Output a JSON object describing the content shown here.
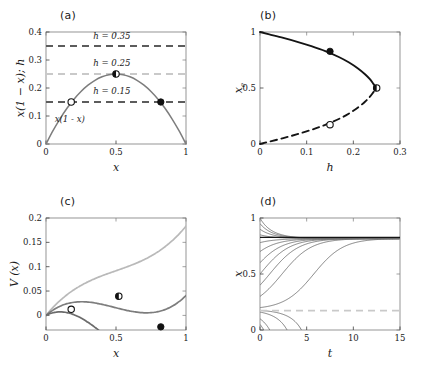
{
  "figure": {
    "panels": [
      {
        "label": "(a)",
        "xlabel": "x",
        "ylabel": "x(1 − x); h",
        "annotation": "x(1 − x)"
      },
      {
        "label": "(b)",
        "xlabel": "h",
        "ylabel": "x"
      },
      {
        "label": "(c)",
        "xlabel": "x",
        "ylabel": "V (x)"
      },
      {
        "label": "(d)",
        "xlabel": "t",
        "ylabel": "x"
      }
    ],
    "ylabel_b_sub": "e",
    "h_line_labels": [
      "h = 0.35",
      "h = 0.25",
      "h = 0.15"
    ]
  },
  "colors": {
    "curve_dark": "#6b6b6b",
    "curve_mid": "#7d7d7d",
    "curve_light": "#b9b9b9",
    "dash_dark": "#5c5c5c",
    "dash_light": "#c9c9c9",
    "solid_black": "#141414",
    "marker_fill": "#111111",
    "marker_open": "#ffffff",
    "axis": "#3d3d3d",
    "frame": "#7a7a7a"
  },
  "chart_data": [
    {
      "panel": "(a)",
      "type": "line",
      "title": "",
      "xlabel": "x",
      "ylabel": "x(1-x); h",
      "xlim": [
        0,
        1
      ],
      "ylim": [
        0,
        0.4
      ],
      "xticks": [
        0,
        0.5,
        1
      ],
      "xticklabels": [
        "0",
        "0.5",
        "1"
      ],
      "yticks": [
        0,
        0.1,
        0.2,
        0.3,
        0.4
      ],
      "yticklabels": [
        "0",
        "0.1",
        "0.2",
        "0.3",
        "0.4"
      ],
      "grid": false,
      "series": [
        {
          "name": "x(1-x)",
          "style": "solid",
          "color": "#7d7d7d",
          "formula": "y = x*(1-x)",
          "x": [
            0,
            0.05,
            0.1,
            0.15,
            0.2,
            0.25,
            0.3,
            0.35,
            0.4,
            0.45,
            0.5,
            0.55,
            0.6,
            0.65,
            0.7,
            0.75,
            0.8,
            0.85,
            0.9,
            0.95,
            1
          ],
          "y": [
            0,
            0.0475,
            0.09,
            0.1275,
            0.16,
            0.1875,
            0.21,
            0.2275,
            0.24,
            0.2475,
            0.25,
            0.2475,
            0.24,
            0.2275,
            0.21,
            0.1875,
            0.16,
            0.1275,
            0.09,
            0.0475,
            0
          ]
        },
        {
          "name": "h = 0.35",
          "style": "dashed",
          "color": "#5c5c5c",
          "value": 0.35
        },
        {
          "name": "h = 0.25",
          "style": "dashed",
          "color": "#c9c9c9",
          "value": 0.25
        },
        {
          "name": "h = 0.15",
          "style": "dashed",
          "color": "#5c5c5c",
          "value": 0.15
        }
      ],
      "markers": [
        {
          "x": 0.18,
          "y": 0.15,
          "fill": "open",
          "note": "unstable equilibrium, h=0.15"
        },
        {
          "x": 0.82,
          "y": 0.15,
          "fill": "solid",
          "note": "stable equilibrium, h=0.15"
        },
        {
          "x": 0.5,
          "y": 0.25,
          "fill": "half",
          "note": "saddle-node point, h=0.25"
        }
      ],
      "annotations": [
        {
          "text": "h = 0.35",
          "x": 0.47,
          "y": 0.375
        },
        {
          "text": "h = 0.25",
          "x": 0.47,
          "y": 0.277
        },
        {
          "text": "h = 0.15",
          "x": 0.47,
          "y": 0.177
        },
        {
          "text": "x(1 - x)",
          "x": 0.17,
          "y": 0.078
        }
      ]
    },
    {
      "panel": "(b)",
      "type": "line",
      "title": "",
      "xlabel": "h",
      "ylabel": "x_e",
      "xlim": [
        0,
        0.3
      ],
      "ylim": [
        0,
        1
      ],
      "xticks": [
        0,
        0.1,
        0.2,
        0.3
      ],
      "xticklabels": [
        "0",
        "0.1",
        "0.2",
        "0.3"
      ],
      "yticks": [
        0,
        0.5,
        1
      ],
      "yticklabels": [
        "0",
        "0.5",
        "1"
      ],
      "grid": false,
      "series": [
        {
          "name": "stable branch",
          "style": "solid",
          "color": "#141414",
          "formula": "x = (1 + sqrt(1-4h))/2",
          "x": [
            0,
            0.02,
            0.05,
            0.08,
            0.11,
            0.14,
            0.17,
            0.19,
            0.21,
            0.225,
            0.235,
            0.243,
            0.2475,
            0.2495,
            0.25
          ],
          "y": [
            1,
            0.9791,
            0.9472,
            0.9123,
            0.8735,
            0.829,
            0.7746,
            0.7294,
            0.6741,
            0.6225,
            0.5806,
            0.5374,
            0.5112,
            0.505,
            0.5
          ]
        },
        {
          "name": "unstable branch",
          "style": "dashed",
          "color": "#141414",
          "formula": "x = (1 - sqrt(1-4h))/2",
          "x": [
            0,
            0.02,
            0.05,
            0.08,
            0.11,
            0.14,
            0.17,
            0.19,
            0.21,
            0.225,
            0.235,
            0.243,
            0.2475,
            0.2495,
            0.25
          ],
          "y": [
            0,
            0.0209,
            0.0528,
            0.0877,
            0.1265,
            0.171,
            0.2254,
            0.2706,
            0.3259,
            0.3775,
            0.4194,
            0.4626,
            0.4888,
            0.495,
            0.5
          ]
        }
      ],
      "markers": [
        {
          "x": 0.15,
          "y": 0.8273,
          "fill": "solid",
          "note": "stable equilibrium at h=0.15"
        },
        {
          "x": 0.15,
          "y": 0.1727,
          "fill": "open",
          "note": "unstable equilibrium at h=0.15"
        },
        {
          "x": 0.25,
          "y": 0.5,
          "fill": "half",
          "note": "saddle-node bifurcation"
        }
      ]
    },
    {
      "panel": "(c)",
      "type": "line",
      "title": "",
      "xlabel": "x",
      "ylabel": "V (x)",
      "xlim": [
        0,
        1
      ],
      "ylim": [
        -0.03,
        0.2
      ],
      "xticks": [
        0,
        0.5,
        1
      ],
      "xticklabels": [
        "0",
        "0.5",
        "1"
      ],
      "yticks": [
        0,
        0.05,
        0.1,
        0.15,
        0.2
      ],
      "yticklabels": [
        "0",
        "0.05",
        "0.1",
        "0.15",
        "0.2"
      ],
      "grid": false,
      "series": [
        {
          "name": "h = 0.35",
          "style": "solid",
          "color": "#b9b9b9",
          "formula": "V = h*x - x^2/2 + x^3/3, h=0.35",
          "x": [
            0,
            0.1,
            0.2,
            0.3,
            0.4,
            0.5,
            0.6,
            0.7,
            0.8,
            0.9,
            1
          ],
          "y": [
            0,
            0.0303,
            0.0627,
            0.099,
            0.1413,
            0.1917,
            0.252,
            0.3243,
            0.4107,
            0.513,
            0.6333
          ]
        },
        {
          "name": "h = 0.25",
          "style": "solid",
          "color": "#7d7d7d",
          "formula": "V = h*x - x^2/2 + x^3/3, h=0.25",
          "x": [
            0,
            0.1,
            0.2,
            0.3,
            0.4,
            0.5,
            0.6,
            0.7,
            0.8,
            0.9,
            1
          ],
          "y": [
            0,
            0.0203,
            0.0427,
            0.069,
            0.1013,
            0.1417,
            0.192,
            0.2543,
            0.3307,
            0.423,
            0.5333
          ]
        },
        {
          "name": "h = 0.15",
          "style": "solid",
          "color": "#7d7d7d",
          "formula": "V = h*x - x^2/2 + x^3/3, h=0.15",
          "x": [
            0,
            0.1,
            0.2,
            0.3,
            0.4,
            0.5,
            0.6,
            0.7,
            0.8,
            0.9,
            1
          ],
          "y": [
            0,
            0.0103,
            0.0227,
            0.039,
            0.0613,
            0.0917,
            0.132,
            0.1843,
            0.2507,
            0.333,
            0.4333
          ]
        }
      ],
      "markers": [
        {
          "x": 0.18,
          "y": 0.0125,
          "fill": "open",
          "note": "local max of V, h=0.15"
        },
        {
          "x": 0.82,
          "y": -0.0235,
          "fill": "solid",
          "note": "local min of V, h=0.15"
        },
        {
          "x": 0.52,
          "y": 0.0395,
          "fill": "half",
          "note": "inflection of V, h=0.25"
        }
      ]
    },
    {
      "panel": "(d)",
      "type": "line",
      "title": "",
      "xlabel": "t",
      "ylabel": "x",
      "xlim": [
        0,
        15
      ],
      "ylim": [
        0,
        1
      ],
      "xticks": [
        0,
        5,
        10,
        15
      ],
      "xticklabels": [
        "0",
        "5",
        "10",
        "15"
      ],
      "yticks": [
        0,
        0.5,
        1
      ],
      "yticklabels": [
        "0",
        "0.5",
        "1"
      ],
      "grid": false,
      "description": "Trajectories of dx/dt = x(1-x) - h with h = 0.15 from various initial conditions",
      "stable_equilibrium": 0.8273,
      "unstable_equilibrium": 0.1727,
      "initial_conditions": [
        1.0,
        0.95,
        0.9,
        0.85,
        0.78,
        0.7,
        0.6,
        0.5,
        0.4,
        0.3,
        0.2,
        0.175,
        0.16,
        0.1,
        0.05
      ],
      "series": [
        {
          "name": "stable equilibrium line",
          "style": "solid",
          "color": "#141414",
          "value": 0.8273
        },
        {
          "name": "unstable equilibrium line",
          "style": "dashed",
          "color": "#c9c9c9",
          "value": 0.1727
        }
      ]
    }
  ]
}
